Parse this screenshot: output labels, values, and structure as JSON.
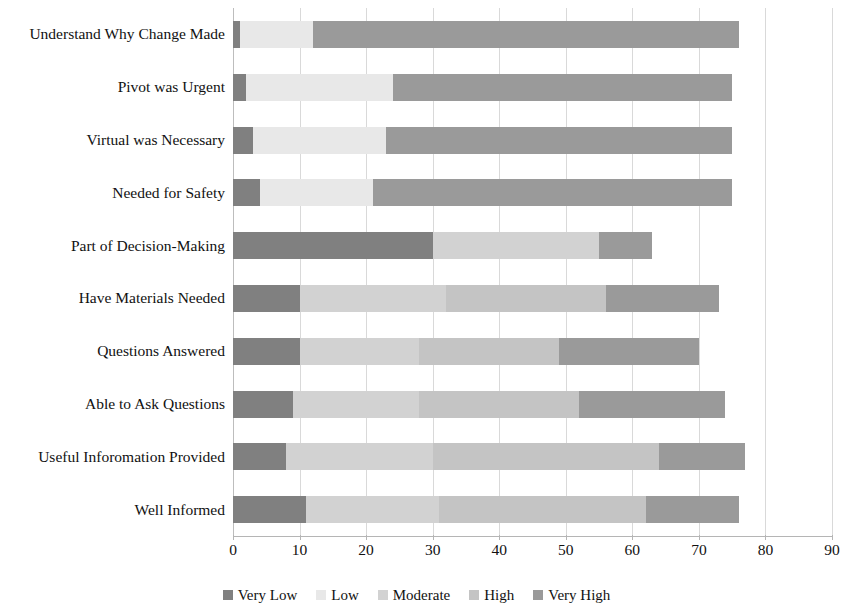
{
  "chart_data": {
    "type": "bar",
    "orientation": "horizontal",
    "stacked": true,
    "title": "",
    "xlabel": "",
    "ylabel": "",
    "xlim": [
      0,
      90
    ],
    "xticks": [
      0,
      10,
      20,
      30,
      40,
      50,
      60,
      70,
      80,
      90
    ],
    "grid": true,
    "legend_position": "bottom",
    "categories": [
      "Understand Why Change Made",
      "Pivot was Urgent",
      "Virtual was Necessary",
      "Needed for Safety",
      "Part of Decision-Making",
      "Have Materials Needed",
      "Questions Answered",
      "Able to Ask Questions",
      "Useful Inforomation Provided",
      "Well Informed"
    ],
    "series": [
      {
        "name": "Very Low",
        "color": "#808080",
        "values": [
          1,
          2,
          3,
          4,
          30,
          10,
          10,
          9,
          8,
          11
        ]
      },
      {
        "name": "Low",
        "color": "#e8e8e8",
        "values": [
          11,
          22,
          20,
          17,
          0,
          0,
          0,
          0,
          0,
          0
        ]
      },
      {
        "name": "Moderate",
        "color": "#d2d2d2",
        "values": [
          0,
          0,
          0,
          0,
          25,
          22,
          18,
          19,
          22,
          20
        ]
      },
      {
        "name": "High",
        "color": "#c4c4c4",
        "values": [
          0,
          0,
          0,
          0,
          0,
          24,
          21,
          24,
          34,
          31
        ]
      },
      {
        "name": "Very High",
        "color": "#9a9a9a",
        "values": [
          64,
          51,
          52,
          54,
          8,
          17,
          21,
          22,
          13,
          14
        ]
      }
    ],
    "totals": [
      76,
      75,
      75,
      75,
      63,
      73,
      70,
      74,
      77,
      76
    ]
  }
}
